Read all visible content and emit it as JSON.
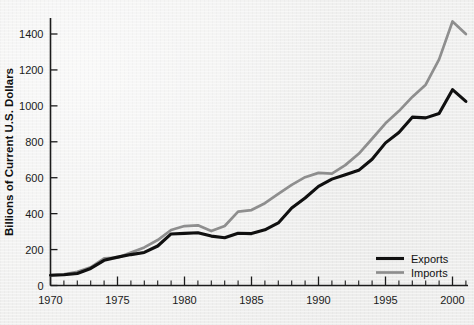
{
  "chart_data": {
    "type": "line",
    "title": "",
    "xlabel": "",
    "ylabel": "Billions of Current U.S. Dollars",
    "xlim": [
      1970,
      2001
    ],
    "ylim": [
      0,
      1500
    ],
    "grid": false,
    "legend_position": "bottom-right",
    "x_tick_labels": [
      "1970",
      "1975",
      "1980",
      "1985",
      "1990",
      "1995",
      "2000"
    ],
    "x_tick_values": [
      1970,
      1975,
      1980,
      1985,
      1990,
      1995,
      2000
    ],
    "x_minor_tick_interval": 1,
    "y_tick_labels": [
      "0",
      "200",
      "400",
      "600",
      "800",
      "1000",
      "1200",
      "1400"
    ],
    "y_tick_values": [
      0,
      200,
      400,
      600,
      800,
      1000,
      1200,
      1400
    ],
    "x": [
      1970,
      1971,
      1972,
      1973,
      1974,
      1975,
      1976,
      1977,
      1978,
      1979,
      1980,
      1981,
      1982,
      1983,
      1984,
      1985,
      1986,
      1987,
      1988,
      1989,
      1990,
      1991,
      1992,
      1993,
      1994,
      1995,
      1996,
      1997,
      1998,
      1999,
      2000,
      2001
    ],
    "series": [
      {
        "name": "Exports",
        "color": "#101010",
        "values": [
          57,
          60,
          67,
          95,
          140,
          158,
          172,
          184,
          220,
          287,
          290,
          294,
          275,
          266,
          291,
          289,
          310,
          348,
          431,
          487,
          552,
          592,
          617,
          641,
          703,
          794,
          852,
          937,
          933,
          957,
          1090,
          1025
        ]
      },
      {
        "name": "Imports",
        "color": "#8e8e8e",
        "values": [
          56,
          62,
          76,
          101,
          151,
          155,
          183,
          212,
          253,
          309,
          331,
          335,
          303,
          331,
          411,
          420,
          458,
          510,
          560,
          603,
          627,
          623,
          670,
          733,
          817,
          903,
          971,
          1050,
          1118,
          1259,
          1470,
          1400
        ]
      }
    ]
  },
  "legend": {
    "items": [
      {
        "label": "Exports"
      },
      {
        "label": "Imports"
      }
    ]
  }
}
